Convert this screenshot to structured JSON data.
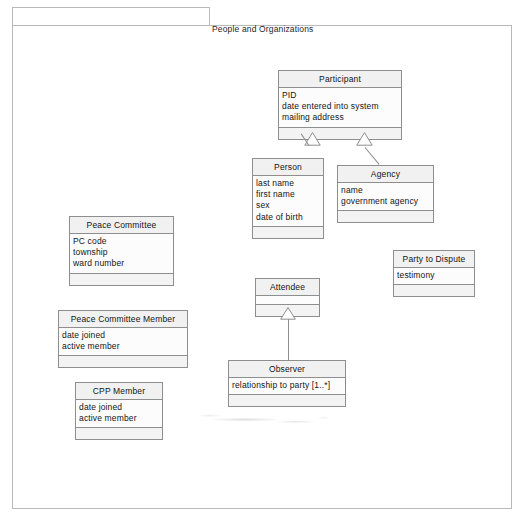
{
  "diagram": {
    "kind": "uml-class-diagram",
    "package": {
      "name": "People and Organizations"
    },
    "colors": {
      "border": "#8e8e8e",
      "header_fill": "#f1f1f1",
      "body_fill": "#fcfcfc",
      "ops_fill": "#f3f3f3",
      "frame_border": "#b9b9b9",
      "text": "#141414"
    },
    "classes": [
      {
        "id": "participant",
        "name": "Participant",
        "attributes": [
          "PID",
          "date entered into system",
          "mailing address"
        ],
        "operations": []
      },
      {
        "id": "person",
        "name": "Person",
        "attributes": [
          "last name",
          "first name",
          "sex",
          "date of birth"
        ],
        "operations": []
      },
      {
        "id": "agency",
        "name": "Agency",
        "attributes": [
          "name",
          "government agency"
        ],
        "operations": []
      },
      {
        "id": "peace-committee",
        "name": "Peace Committee",
        "attributes": [
          "PC code",
          "township",
          "ward number"
        ],
        "operations": []
      },
      {
        "id": "peace-committee-member",
        "name": "Peace Committee Member",
        "attributes": [
          "date joined",
          "active member"
        ],
        "operations": []
      },
      {
        "id": "cpp-member",
        "name": "CPP Member",
        "attributes": [
          "date joined",
          "active member"
        ],
        "operations": []
      },
      {
        "id": "party-to-dispute",
        "name": "Party to Dispute",
        "attributes": [
          "testimony"
        ],
        "operations": []
      },
      {
        "id": "attendee",
        "name": "Attendee",
        "attributes": [],
        "operations": []
      },
      {
        "id": "observer",
        "name": "Observer",
        "attributes": [
          "relationship to party [1..*]"
        ],
        "operations": []
      }
    ],
    "relationships": [
      {
        "type": "generalization",
        "from": "person",
        "to": "participant"
      },
      {
        "type": "generalization",
        "from": "agency",
        "to": "participant"
      },
      {
        "type": "generalization",
        "from": "observer",
        "to": "attendee"
      }
    ]
  }
}
